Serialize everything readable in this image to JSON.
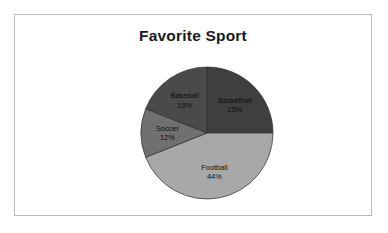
{
  "chart": {
    "title": "Favorite Sport",
    "frame_border_color": "#b9b9b9",
    "background_color": "#ffffff"
  },
  "chart_data": {
    "type": "pie",
    "title": "Favorite Sport",
    "xlabel": "",
    "ylabel": "",
    "legend": false,
    "grid": false,
    "start_angle_deg": 0,
    "direction": "clockwise",
    "categories": [
      "Basketball",
      "Football",
      "Soccer",
      "Baseball"
    ],
    "values": [
      25,
      44,
      12,
      19
    ],
    "value_unit": "%",
    "colors": [
      "#3f3f3f",
      "#a8a8a8",
      "#707070",
      "#4a4a4a"
    ],
    "slices": [
      {
        "label": "Basketball",
        "value": 25,
        "display": "25%",
        "color": "#3f3f3f"
      },
      {
        "label": "Football",
        "value": 44,
        "display": "44%",
        "color": "#a8a8a8"
      },
      {
        "label": "Soccer",
        "value": 12,
        "display": "12%",
        "color": "#707070"
      },
      {
        "label": "Baseball",
        "value": 19,
        "display": "19%",
        "color": "#4a4a4a"
      }
    ]
  }
}
